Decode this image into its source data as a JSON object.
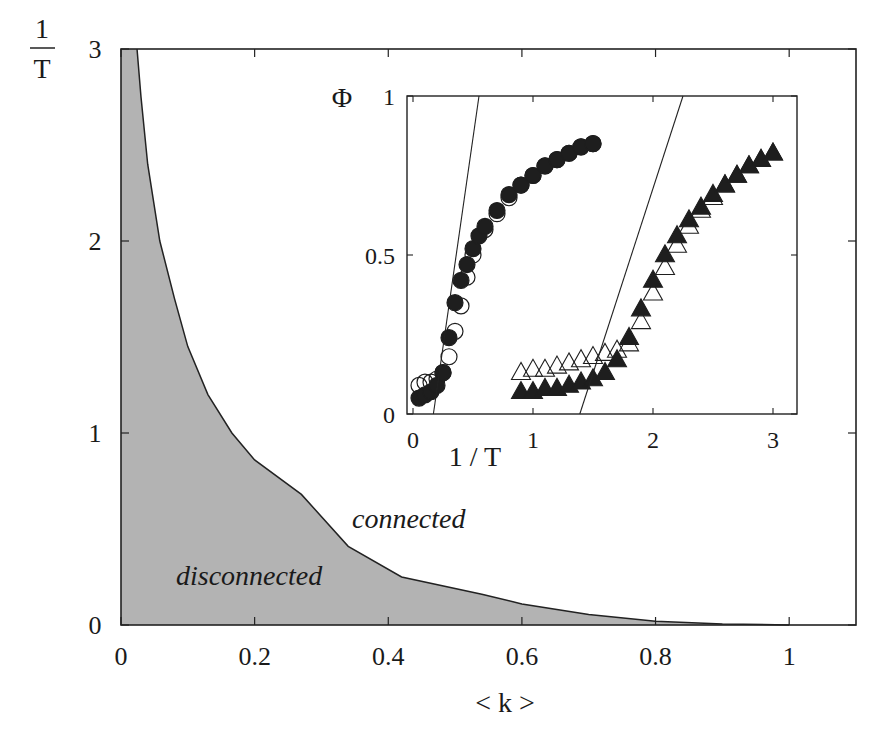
{
  "chart_data": [
    {
      "id": "main",
      "type": "area",
      "title": "",
      "xlabel": "< k >",
      "ylabel_numerator": "1",
      "ylabel_denominator": "T",
      "xlim": [
        0,
        1.1
      ],
      "ylim": [
        0,
        3
      ],
      "xticks": [
        0,
        0.2,
        0.4,
        0.6,
        0.8,
        1
      ],
      "xtick_labels": [
        "0",
        "0.2",
        "0.4",
        "0.6",
        "0.8",
        "1"
      ],
      "yticks": [
        0,
        1,
        2,
        3
      ],
      "ytick_labels": [
        "0",
        "1",
        "2",
        "3"
      ],
      "grid": false,
      "fill_color": "#b3b3b3",
      "boundary": {
        "name": "phase boundary",
        "x": [
          0.024,
          0.03,
          0.04,
          0.058,
          0.08,
          0.1,
          0.13,
          0.166,
          0.2,
          0.27,
          0.34,
          0.42,
          0.54,
          0.6,
          0.7,
          0.8,
          0.9,
          1.0
        ],
        "y": [
          3.0,
          2.75,
          2.4,
          2.0,
          1.7,
          1.45,
          1.2,
          1.0,
          0.86,
          0.68,
          0.41,
          0.25,
          0.16,
          0.11,
          0.055,
          0.02,
          0.005,
          0.0
        ]
      },
      "annotations": [
        {
          "text": "connected",
          "x": 0.52,
          "y": 0.55
        },
        {
          "text": "disconnected",
          "x": 0.08,
          "y": 0.25
        }
      ]
    },
    {
      "id": "inset",
      "type": "scatter",
      "title": "",
      "xlabel": "1 / T",
      "ylabel": "Φ",
      "xlim": [
        -0.05,
        3.2
      ],
      "ylim": [
        0,
        1
      ],
      "xticks": [
        0,
        1,
        2,
        3
      ],
      "xtick_labels": [
        "0",
        "1",
        "2",
        "3"
      ],
      "yticks": [
        0,
        0.5,
        1
      ],
      "ytick_labels": [
        "0",
        "0.5",
        "1"
      ],
      "grid": false,
      "series": [
        {
          "name": "circles filled",
          "marker": "circle-filled",
          "x": [
            0.05,
            0.1,
            0.15,
            0.2,
            0.25,
            0.3,
            0.35,
            0.4,
            0.45,
            0.5,
            0.55,
            0.6,
            0.7,
            0.8,
            0.9,
            1.0,
            1.1,
            1.2,
            1.3,
            1.4,
            1.5
          ],
          "y": [
            0.05,
            0.06,
            0.07,
            0.09,
            0.13,
            0.24,
            0.35,
            0.42,
            0.47,
            0.52,
            0.56,
            0.59,
            0.64,
            0.69,
            0.72,
            0.75,
            0.78,
            0.8,
            0.82,
            0.84,
            0.85
          ]
        },
        {
          "name": "circles open",
          "marker": "circle-open",
          "x": [
            0.05,
            0.1,
            0.15,
            0.2,
            0.25,
            0.3,
            0.35,
            0.4,
            0.45,
            0.5,
            0.6,
            0.7,
            0.8,
            0.9,
            1.0,
            1.1,
            1.2,
            1.3,
            1.4,
            1.5
          ],
          "y": [
            0.09,
            0.1,
            0.1,
            0.11,
            0.13,
            0.18,
            0.26,
            0.34,
            0.43,
            0.5,
            0.58,
            0.63,
            0.68,
            0.72,
            0.75,
            0.78,
            0.8,
            0.82,
            0.84,
            0.85
          ]
        },
        {
          "name": "triangles filled",
          "marker": "triangle-filled",
          "x": [
            0.9,
            1.0,
            1.1,
            1.2,
            1.3,
            1.4,
            1.5,
            1.6,
            1.7,
            1.8,
            1.9,
            2.0,
            2.1,
            2.2,
            2.3,
            2.4,
            2.5,
            2.6,
            2.7,
            2.8,
            2.9,
            3.0
          ],
          "y": [
            0.07,
            0.07,
            0.08,
            0.08,
            0.09,
            0.1,
            0.11,
            0.13,
            0.17,
            0.24,
            0.33,
            0.42,
            0.5,
            0.56,
            0.61,
            0.65,
            0.69,
            0.72,
            0.75,
            0.78,
            0.8,
            0.82
          ]
        },
        {
          "name": "triangles open",
          "marker": "triangle-open",
          "x": [
            0.9,
            1.0,
            1.1,
            1.2,
            1.3,
            1.4,
            1.5,
            1.6,
            1.7,
            1.8,
            1.9,
            2.0,
            2.1,
            2.2,
            2.3,
            2.4,
            2.5,
            2.6,
            2.7,
            2.8,
            2.9,
            3.0
          ],
          "y": [
            0.13,
            0.14,
            0.14,
            0.15,
            0.16,
            0.17,
            0.18,
            0.19,
            0.2,
            0.22,
            0.29,
            0.38,
            0.46,
            0.53,
            0.59,
            0.64,
            0.68,
            0.72,
            0.75,
            0.78,
            0.8,
            0.82
          ]
        }
      ],
      "fit_lines": [
        {
          "name": "left fit line",
          "x": [
            0.17,
            0.55
          ],
          "y": [
            0,
            1
          ]
        },
        {
          "name": "right fit line",
          "x": [
            1.39,
            2.25
          ],
          "y": [
            0,
            1
          ]
        }
      ]
    }
  ]
}
